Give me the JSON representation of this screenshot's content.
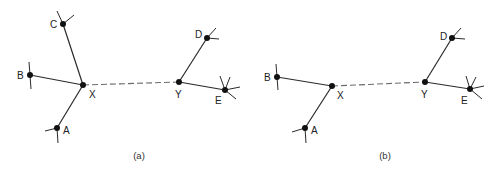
{
  "figure": {
    "panels": [
      {
        "id": "a",
        "caption": "(a)",
        "caption_pos": [
          139,
          159
        ],
        "nodes": {
          "A": {
            "label": "A",
            "x": 57,
            "y": 128,
            "lx": 63,
            "ly": 134
          },
          "B": {
            "label": "B",
            "x": 30,
            "y": 75,
            "lx": 17,
            "ly": 79
          },
          "C": {
            "label": "C",
            "x": 63,
            "y": 24,
            "lx": 50,
            "ly": 28
          },
          "X": {
            "label": "X",
            "x": 83,
            "y": 85,
            "lx": 89,
            "ly": 98
          },
          "Y": {
            "label": "Y",
            "x": 179,
            "y": 82,
            "lx": 175,
            "ly": 98
          },
          "D": {
            "label": "D",
            "x": 207,
            "y": 38,
            "lx": 195,
            "ly": 38
          },
          "E": {
            "label": "E",
            "x": 225,
            "y": 90,
            "lx": 215,
            "ly": 104
          }
        },
        "solid_edges": [
          [
            "X",
            "A"
          ],
          [
            "X",
            "B"
          ],
          [
            "X",
            "C"
          ],
          [
            "Y",
            "D"
          ],
          [
            "Y",
            "E"
          ]
        ],
        "dashed_edges": [
          [
            "X",
            "Y"
          ]
        ],
        "spokes": [
          [
            57,
            128,
            45,
            131
          ],
          [
            57,
            128,
            58,
            143
          ],
          [
            30,
            75,
            29,
            62
          ],
          [
            30,
            75,
            31,
            89
          ],
          [
            63,
            24,
            57,
            11
          ],
          [
            63,
            24,
            74,
            15
          ],
          [
            207,
            38,
            216,
            28
          ],
          [
            207,
            38,
            219,
            39
          ],
          [
            225,
            90,
            220,
            76
          ],
          [
            225,
            90,
            230,
            77
          ],
          [
            225,
            90,
            240,
            87
          ],
          [
            225,
            90,
            236,
            99
          ]
        ]
      },
      {
        "id": "b",
        "caption": "(b)",
        "caption_pos": [
          385,
          159
        ],
        "nodes": {
          "A": {
            "label": "A",
            "x": 305,
            "y": 128,
            "lx": 311,
            "ly": 134
          },
          "B": {
            "label": "B",
            "x": 277,
            "y": 77,
            "lx": 264,
            "ly": 81
          },
          "X": {
            "label": "X",
            "x": 332,
            "y": 86,
            "lx": 337,
            "ly": 99
          },
          "Y": {
            "label": "Y",
            "x": 425,
            "y": 82,
            "lx": 421,
            "ly": 98
          },
          "D": {
            "label": "D",
            "x": 452,
            "y": 38,
            "lx": 440,
            "ly": 40
          },
          "E": {
            "label": "E",
            "x": 470,
            "y": 89,
            "lx": 461,
            "ly": 104
          }
        },
        "solid_edges": [
          [
            "X",
            "A"
          ],
          [
            "X",
            "B"
          ],
          [
            "Y",
            "D"
          ],
          [
            "Y",
            "E"
          ]
        ],
        "dashed_edges": [
          [
            "X",
            "Y"
          ]
        ],
        "spokes": [
          [
            305,
            128,
            292,
            132
          ],
          [
            305,
            128,
            306,
            143
          ],
          [
            277,
            77,
            276,
            64
          ],
          [
            277,
            77,
            278,
            90
          ],
          [
            452,
            38,
            461,
            28
          ],
          [
            452,
            38,
            465,
            39
          ],
          [
            470,
            89,
            466,
            76
          ],
          [
            470,
            89,
            476,
            77
          ],
          [
            470,
            89,
            484,
            86
          ],
          [
            470,
            89,
            482,
            99
          ]
        ]
      }
    ]
  }
}
